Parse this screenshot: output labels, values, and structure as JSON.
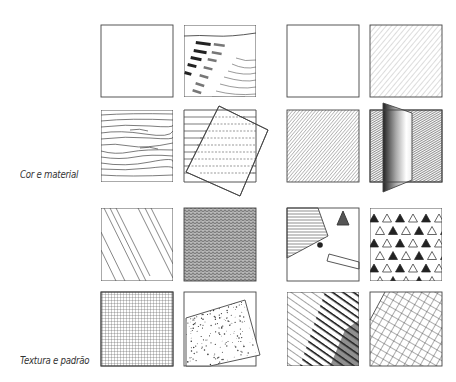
{
  "labels": {
    "color_material": "Cor e material",
    "texture_pattern": "Textura e padrão"
  },
  "colors": {
    "ink": "#333333",
    "paper": "#ffffff",
    "dark_fill": "#2a2a2a"
  },
  "groups": [
    {
      "name": "Cor e material",
      "panels": [
        {
          "id": "blank-1",
          "description": "empty square"
        },
        {
          "id": "brick-perspective",
          "description": "bricks receding in perspective"
        },
        {
          "id": "blank-2",
          "description": "empty square"
        },
        {
          "id": "light-hatching",
          "description": "light diagonal pencil hatching"
        },
        {
          "id": "wood-grain",
          "description": "wood grain lines"
        },
        {
          "id": "lines-rotated-square",
          "description": "horizontal lines with overlapping rotated square and dashed lines"
        },
        {
          "id": "medium-hatching",
          "description": "medium diagonal pencil hatching"
        },
        {
          "id": "gradient-plane",
          "description": "dark frame with shaded gradient plane"
        }
      ]
    },
    {
      "name": "Textura e padrão",
      "panels": [
        {
          "id": "diagonal-strokes",
          "description": "sparse diagonal strokes"
        },
        {
          "id": "dense-texture",
          "description": "dense scribbled texture"
        },
        {
          "id": "shapes-composition",
          "description": "hatched polygon, triangle, dot and rectangle"
        },
        {
          "id": "triangle-pattern",
          "description": "alternating filled and open triangles"
        },
        {
          "id": "fine-grid",
          "description": "fine grid"
        },
        {
          "id": "stipple-rotated",
          "description": "stippled rotated square"
        },
        {
          "id": "diagonal-stripes",
          "description": "diagonal stripes getting darker"
        },
        {
          "id": "rotated-grid",
          "description": "rotated grid of squares"
        }
      ]
    }
  ]
}
